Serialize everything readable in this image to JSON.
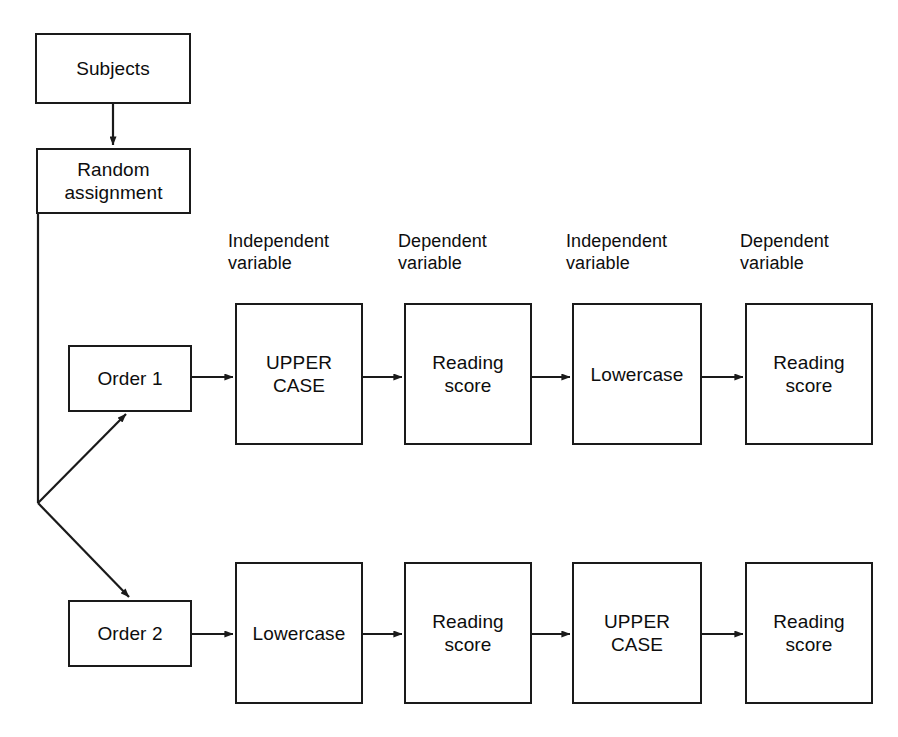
{
  "diagram": {
    "background_color": "#ffffff",
    "line_color": "#1a1a1a",
    "text_color": "#0d0d0d",
    "column_headers": [
      {
        "id": "header-iv-1",
        "text": "Independent\nvariable",
        "x": 228,
        "y": 230
      },
      {
        "id": "header-dv-1",
        "text": "Dependent\nvariable",
        "x": 398,
        "y": 230
      },
      {
        "id": "header-iv-2",
        "text": "Independent\nvariable",
        "x": 566,
        "y": 230
      },
      {
        "id": "header-dv-2",
        "text": "Dependent\nvariable",
        "x": 740,
        "y": 230
      }
    ],
    "nodes": [
      {
        "id": "subjects",
        "text": "Subjects",
        "x": 35,
        "y": 33,
        "w": 156,
        "h": 71
      },
      {
        "id": "random",
        "text": "Random\nassignment",
        "x": 36,
        "y": 148,
        "w": 155,
        "h": 66
      },
      {
        "id": "order-1",
        "text": "Order 1",
        "x": 68,
        "y": 345,
        "w": 124,
        "h": 67
      },
      {
        "id": "order-2",
        "text": "Order 2",
        "x": 68,
        "y": 600,
        "w": 124,
        "h": 67
      },
      {
        "id": "r1-iv1",
        "text": "UPPER\nCASE",
        "x": 235,
        "y": 303,
        "w": 128,
        "h": 142
      },
      {
        "id": "r1-dv1",
        "text": "Reading\nscore",
        "x": 404,
        "y": 303,
        "w": 128,
        "h": 142
      },
      {
        "id": "r1-iv2",
        "text": "Lowercase",
        "x": 572,
        "y": 303,
        "w": 130,
        "h": 142
      },
      {
        "id": "r1-dv2",
        "text": "Reading\nscore",
        "x": 745,
        "y": 303,
        "w": 128,
        "h": 142
      },
      {
        "id": "r2-iv1",
        "text": "Lowercase",
        "x": 235,
        "y": 562,
        "w": 128,
        "h": 142
      },
      {
        "id": "r2-dv1",
        "text": "Reading\nscore",
        "x": 404,
        "y": 562,
        "w": 128,
        "h": 142
      },
      {
        "id": "r2-iv2",
        "text": "UPPER\nCASE",
        "x": 572,
        "y": 562,
        "w": 130,
        "h": 142
      },
      {
        "id": "r2-dv2",
        "text": "Reading\nscore",
        "x": 745,
        "y": 562,
        "w": 128,
        "h": 142
      }
    ],
    "connectors": [
      {
        "id": "subjects-to-random",
        "kind": "arrow-down",
        "from": "subjects",
        "to": "random",
        "x1": 113,
        "y1": 104,
        "x2": 113,
        "y2": 146
      },
      {
        "id": "random-to-branch",
        "kind": "elbow",
        "from": "random",
        "to": "branch",
        "x1": 38,
        "y1": 214,
        "x2": 38,
        "y2": 503
      },
      {
        "id": "branch-to-order-1",
        "kind": "arrow-diag-up",
        "from": "branch",
        "to": "order-1",
        "x1": 38,
        "y1": 503,
        "x2": 125,
        "y2": 414
      },
      {
        "id": "branch-to-order-2",
        "kind": "arrow-diag-dn",
        "from": "branch",
        "to": "order-2",
        "x1": 38,
        "y1": 503,
        "x2": 128,
        "y2": 597
      },
      {
        "id": "order1-to-r1-iv1",
        "kind": "arrow-right",
        "from": "order-1",
        "to": "r1-iv1",
        "x1": 192,
        "y1": 377,
        "x2": 232,
        "y2": 377
      },
      {
        "id": "r1-iv1-to-r1-dv1",
        "kind": "arrow-right",
        "from": "r1-iv1",
        "to": "r1-dv1",
        "x1": 363,
        "y1": 377,
        "x2": 401,
        "y2": 377
      },
      {
        "id": "r1-dv1-to-r1-iv2",
        "kind": "arrow-right",
        "from": "r1-dv1",
        "to": "r1-iv2",
        "x1": 532,
        "y1": 377,
        "x2": 569,
        "y2": 377
      },
      {
        "id": "r1-iv2-to-r1-dv2",
        "kind": "arrow-right",
        "from": "r1-iv2",
        "to": "r1-dv2",
        "x1": 702,
        "y1": 377,
        "x2": 742,
        "y2": 377
      },
      {
        "id": "order2-to-r2-iv1",
        "kind": "arrow-right",
        "from": "order-2",
        "to": "r2-iv1",
        "x1": 192,
        "y1": 634,
        "x2": 232,
        "y2": 634
      },
      {
        "id": "r2-iv1-to-r2-dv1",
        "kind": "arrow-right",
        "from": "r2-iv1",
        "to": "r2-dv1",
        "x1": 363,
        "y1": 634,
        "x2": 401,
        "y2": 634
      },
      {
        "id": "r2-dv1-to-r2-iv2",
        "kind": "arrow-right",
        "from": "r2-dv1",
        "to": "r2-iv2",
        "x1": 532,
        "y1": 634,
        "x2": 569,
        "y2": 634
      },
      {
        "id": "r2-iv2-to-r2-dv2",
        "kind": "arrow-right",
        "from": "r2-iv2",
        "to": "r2-dv2",
        "x1": 702,
        "y1": 634,
        "x2": 742,
        "y2": 634
      }
    ]
  }
}
